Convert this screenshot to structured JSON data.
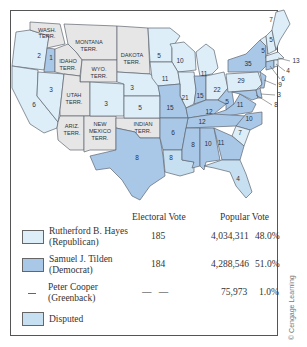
{
  "map": {
    "territories": [
      {
        "name": "WASH.",
        "line2": "TERR."
      },
      {
        "name": "MONTANA",
        "line2": "TERR."
      },
      {
        "name": "DAKOTA",
        "line2": "TERR."
      },
      {
        "name": "IDAHO",
        "line2": "TERR."
      },
      {
        "name": "WYO.",
        "line2": "TERR."
      },
      {
        "name": "UTAH",
        "line2": "TERR."
      },
      {
        "name": "ARIZ.",
        "line2": "TERR."
      },
      {
        "name": "NEW",
        "line2": "MEXICO",
        "line3": "TERR."
      },
      {
        "name": "INDIAN",
        "line2": "TERR."
      }
    ],
    "states": {
      "oregon": "3",
      "idaho_strip": "1",
      "california": "6",
      "nevada": "3",
      "colorado": "3",
      "nebraska": "3",
      "kansas": "5",
      "minnesota": "5",
      "wisconsin": "10",
      "iowa": "11",
      "michigan": "11",
      "illinois": "21",
      "indiana": "15",
      "ohio": "22",
      "missouri": "15",
      "kentucky": "12",
      "west_virginia": "5",
      "virginia": "11",
      "tennessee": "12",
      "north_carolina": "10",
      "south_carolina": "7",
      "georgia": "11",
      "alabama": "10",
      "mississippi": "8",
      "louisiana": "8",
      "arkansas": "6",
      "texas": "8",
      "florida": "4",
      "new_york": "35",
      "pennsylvania": "29",
      "maine": "7",
      "vermont": "5",
      "new_hampshire": "5",
      "massachusetts": "13",
      "rhode_island": "4",
      "connecticut": "6",
      "new_jersey": "9",
      "delaware": "3",
      "maryland": "8"
    }
  },
  "legend": {
    "headers": {
      "electoral": "Electoral Vote",
      "popular": "Popular Vote"
    },
    "rows": [
      {
        "name": "Rutherford B. Hayes",
        "party": "(Republican)",
        "electoral": "185",
        "popular": "4,034,311",
        "percent": "48.0%",
        "swatch": "#ddeef8"
      },
      {
        "name": "Samuel J. Tilden",
        "party": "(Democrat)",
        "electoral": "184",
        "popular": "4,288,546",
        "percent": "51.0%",
        "swatch": "#a9c8e8"
      },
      {
        "name": "Peter Cooper",
        "party": "(Greenback)",
        "electoral": "—   —",
        "popular": "75,973",
        "percent": "1.0%",
        "swatch": "dash"
      },
      {
        "name": "Disputed",
        "party": "",
        "swatch": "#c6e0f2"
      }
    ]
  },
  "credit": "© Cengage Learning"
}
